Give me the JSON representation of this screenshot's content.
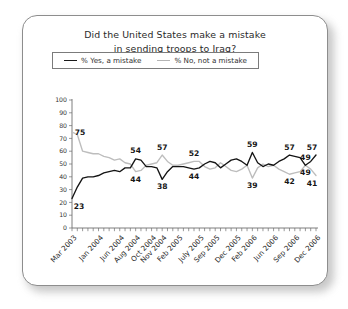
{
  "chart_data": {
    "type": "line",
    "title": "Did the United States make a mistake in sending troops to Iraq?",
    "title_line1": "Did the United States make a mistake",
    "title_line2": "in sending troops to Iraq?",
    "xlabel": "",
    "ylabel": "",
    "ylim": [
      0,
      100
    ],
    "ytick_values": [
      0,
      10,
      20,
      30,
      40,
      50,
      60,
      70,
      80,
      90,
      100
    ],
    "grid": false,
    "legend_position": "top-center",
    "legend": [
      "% Yes, a mistake",
      "% No, not a mistake"
    ],
    "colors": {
      "yes": "#141414",
      "no": "#bdbdbd"
    },
    "xtick_labels": [
      "Mar 2003",
      "Jan 2004",
      "Jun 2004",
      "Aug 2004",
      "Oct 2004",
      "Nov 2004",
      "Feb 2005",
      "July 2005",
      "Sep 2005",
      "Dec 2005",
      "Feb 2006",
      "Jun 2006",
      "Sep 2006",
      "Dec 2006"
    ],
    "xtick_indices": [
      0,
      5,
      9,
      12,
      15,
      17,
      20,
      24,
      27,
      31,
      34,
      38,
      42,
      46
    ],
    "n_points": 47,
    "series": [
      {
        "name": "% Yes, a mistake",
        "values": [
          23,
          32,
          39,
          40,
          40,
          41,
          43,
          44,
          45,
          44,
          47,
          47,
          54,
          53,
          48,
          48,
          47,
          38,
          44,
          48,
          48,
          48,
          47,
          46,
          47,
          50,
          52,
          51,
          47,
          50,
          53,
          54,
          52,
          49,
          59,
          51,
          48,
          50,
          49,
          52,
          54,
          57,
          56,
          55,
          49,
          52,
          57
        ]
      },
      {
        "name": "% No, not a mistake",
        "values": [
          75,
          73,
          60,
          59,
          58,
          58,
          56,
          55,
          53,
          54,
          51,
          50,
          44,
          45,
          49,
          50,
          51,
          57,
          52,
          49,
          49,
          50,
          51,
          52,
          52,
          48,
          46,
          47,
          51,
          48,
          45,
          44,
          46,
          49,
          39,
          47,
          50,
          48,
          49,
          46,
          44,
          42,
          43,
          44,
          49,
          46,
          41
        ]
      }
    ],
    "annotations": [
      {
        "label": "75",
        "series": "no",
        "index": 0,
        "position": "right"
      },
      {
        "label": "23",
        "series": "yes",
        "index": 0,
        "position": "below"
      },
      {
        "label": "54",
        "series": "yes",
        "index": 12,
        "position": "above"
      },
      {
        "label": "44",
        "series": "no",
        "index": 12,
        "position": "below"
      },
      {
        "label": "57",
        "series": "no",
        "index": 17,
        "position": "above"
      },
      {
        "label": "38",
        "series": "yes",
        "index": 17,
        "position": "below"
      },
      {
        "label": "52",
        "series": "no",
        "index": 23,
        "position": "above"
      },
      {
        "label": "44",
        "series": "yes",
        "index": 23,
        "position": "below"
      },
      {
        "label": "59",
        "series": "yes",
        "index": 34,
        "position": "above"
      },
      {
        "label": "39",
        "series": "no",
        "index": 34,
        "position": "below"
      },
      {
        "label": "57",
        "series": "yes",
        "index": 41,
        "position": "above"
      },
      {
        "label": "42",
        "series": "no",
        "index": 41,
        "position": "below"
      },
      {
        "label": "49",
        "series": "yes",
        "index": 44,
        "position": "above"
      },
      {
        "label": "49",
        "series": "no",
        "index": 44,
        "position": "below"
      },
      {
        "label": "57",
        "series": "yes",
        "index": 46,
        "position": "above"
      },
      {
        "label": "41",
        "series": "no",
        "index": 46,
        "position": "below"
      }
    ]
  }
}
